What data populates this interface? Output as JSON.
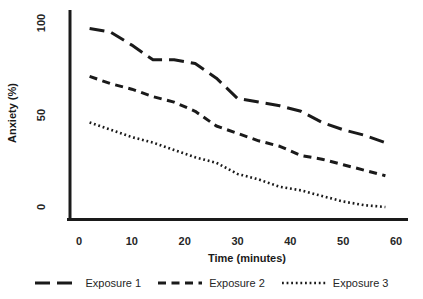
{
  "chart_data": {
    "type": "line",
    "title": "",
    "xlabel": "Time (minutes)",
    "ylabel": "Anxiety (%)",
    "x": [
      2,
      6,
      10,
      14,
      18,
      22,
      26,
      30,
      34,
      38,
      42,
      46,
      50,
      54,
      58
    ],
    "xticks": [
      0,
      10,
      20,
      30,
      40,
      50,
      60
    ],
    "yticks": [
      0,
      50,
      100
    ],
    "xlim": [
      0,
      62
    ],
    "ylim": [
      0,
      100
    ],
    "grid": false,
    "legend_position": "bottom",
    "line_color": "#1a1a1a",
    "axis_color": "#1a1a1a",
    "series": [
      {
        "name": "Exposure 1",
        "dash": "long-dash",
        "values": [
          97,
          95,
          88,
          80,
          80,
          78,
          70,
          59,
          57,
          55,
          52,
          46,
          42,
          39,
          35
        ]
      },
      {
        "name": "Exposure 2",
        "dash": "dash",
        "values": [
          71,
          67,
          64,
          60,
          57,
          52,
          44,
          40,
          36,
          33,
          28,
          26,
          23,
          20,
          17
        ]
      },
      {
        "name": "Exposure 3",
        "dash": "dot",
        "values": [
          46,
          42,
          38,
          35,
          31,
          27,
          24,
          18,
          15,
          11,
          9,
          6,
          3,
          1,
          0
        ]
      }
    ]
  }
}
